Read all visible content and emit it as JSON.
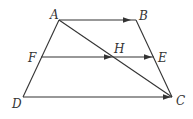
{
  "diagram": {
    "type": "trapezoid",
    "colors": {
      "stroke": "#333333",
      "background": "#ffffff"
    },
    "points": {
      "A": {
        "x": 59,
        "y": 20,
        "label": "A",
        "lx": 50,
        "ly": 19
      },
      "B": {
        "x": 136,
        "y": 20,
        "label": "B",
        "lx": 139,
        "ly": 20
      },
      "C": {
        "x": 172,
        "y": 97,
        "label": "C",
        "lx": 176,
        "ly": 105
      },
      "D": {
        "x": 23,
        "y": 97,
        "label": "D",
        "lx": 12,
        "ly": 108
      },
      "E": {
        "x": 154,
        "y": 57,
        "label": "E",
        "lx": 158,
        "ly": 62
      },
      "F": {
        "x": 41,
        "y": 57,
        "label": "F",
        "lx": 28,
        "ly": 62
      },
      "H": {
        "x": 114,
        "y": 57,
        "label": "H",
        "lx": 114,
        "ly": 53
      }
    },
    "segments": [
      {
        "from": "A",
        "to": "B",
        "arrow_at": 0.95
      },
      {
        "from": "F",
        "to": "E",
        "arrow_at": 0.97
      },
      {
        "from": "F",
        "to": "H",
        "arrow_at": 0.97
      },
      {
        "from": "D",
        "to": "C",
        "arrow_at": 0.99
      },
      {
        "from": "A",
        "to": "D"
      },
      {
        "from": "B",
        "to": "C"
      },
      {
        "from": "A",
        "to": "C"
      }
    ]
  }
}
